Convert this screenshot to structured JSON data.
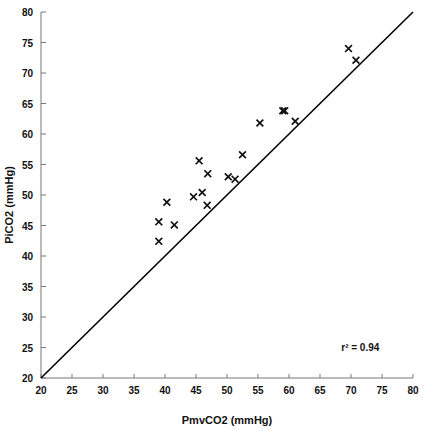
{
  "chart_data": {
    "type": "scatter",
    "title": "",
    "xlabel": "PmvCO2 (mmHg)",
    "ylabel": "PiCO2 (mmHg)",
    "xlim": [
      20,
      80
    ],
    "ylim": [
      20,
      80
    ],
    "xticks": [
      20,
      25,
      30,
      35,
      40,
      45,
      50,
      55,
      60,
      65,
      70,
      75,
      80
    ],
    "yticks": [
      20,
      25,
      30,
      35,
      40,
      45,
      50,
      55,
      60,
      65,
      70,
      75,
      80
    ],
    "grid": false,
    "legend": null,
    "marker_symbol": "x",
    "marker_color": "#111111",
    "series": [
      {
        "name": "PiCO2 vs PmvCO2",
        "points": [
          {
            "x": 39.0,
            "y": 45.6
          },
          {
            "x": 39.0,
            "y": 42.4
          },
          {
            "x": 40.3,
            "y": 48.8
          },
          {
            "x": 41.5,
            "y": 45.1
          },
          {
            "x": 44.6,
            "y": 49.7
          },
          {
            "x": 45.5,
            "y": 55.6
          },
          {
            "x": 46.0,
            "y": 50.4
          },
          {
            "x": 46.8,
            "y": 48.3
          },
          {
            "x": 46.9,
            "y": 53.5
          },
          {
            "x": 50.2,
            "y": 53.0
          },
          {
            "x": 51.3,
            "y": 52.6
          },
          {
            "x": 52.5,
            "y": 56.6
          },
          {
            "x": 55.3,
            "y": 61.8
          },
          {
            "x": 59.0,
            "y": 63.8
          },
          {
            "x": 59.3,
            "y": 63.8
          },
          {
            "x": 61.0,
            "y": 62.1
          },
          {
            "x": 69.6,
            "y": 74.0
          },
          {
            "x": 70.8,
            "y": 72.1
          }
        ]
      }
    ],
    "reference_line": {
      "name": "line-of-identity",
      "from": {
        "x": 20,
        "y": 20
      },
      "to": {
        "x": 80,
        "y": 80
      },
      "color": "#000000"
    },
    "annotations": [
      {
        "name": "r-squared",
        "text": "r² = 0.94",
        "x": 71.5,
        "y": 24.5
      }
    ]
  }
}
